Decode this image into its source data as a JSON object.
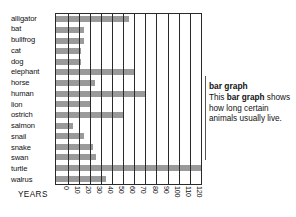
{
  "chart_data": {
    "type": "bar",
    "orientation": "horizontal",
    "title": "",
    "xlabel": "YEARS",
    "ylabel": "",
    "xlim": [
      0,
      120
    ],
    "xticks": [
      "0",
      "10",
      "20",
      "30",
      "40",
      "50",
      "60",
      "70",
      "80",
      "90",
      "100",
      "110",
      "120"
    ],
    "grid": true,
    "legend": false,
    "bar_color": "#9a9a9a",
    "axis_color": "#2a2a2a",
    "categories": [
      "alligator",
      "bat",
      "bullfrog",
      "cat",
      "dog",
      "elephant",
      "horse",
      "human",
      "lion",
      "ostrich",
      "salmon",
      "snail",
      "snake",
      "swan",
      "turtle",
      "walrus"
    ],
    "values": [
      55,
      15,
      15,
      12,
      12,
      60,
      25,
      70,
      20,
      50,
      5,
      15,
      23,
      26,
      120,
      35
    ]
  },
  "axis": {
    "years_label": "YEARS"
  },
  "caption": {
    "title": "bar graph",
    "line1_before": "This ",
    "line1_bold": "bar graph",
    "line1_after": " shows how long certain animals usually live."
  }
}
